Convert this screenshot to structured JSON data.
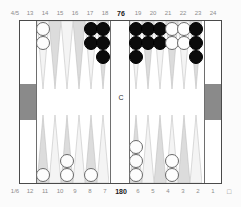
{
  "board": {
    "title": "backgammon-position-diagram",
    "bar_label": "C",
    "pip_top": "76",
    "pip_bottom": "180",
    "top_left_edge_label": "4/5",
    "bottom_left_edge_label": "1/6",
    "bottom_right_glyph": "□",
    "colors": {
      "black_checker": "#0b0b0b",
      "white_checker": "#fdfdfd",
      "point_dark": "#d7d7d7",
      "point_light": "#f4f4f4",
      "tray": "#8a8a8a",
      "frame_line": "#4a4a4a",
      "label_text": "#8c8c8c",
      "bold_text": "#1a1a1a"
    }
  },
  "labels": {
    "top": [
      "13",
      "14",
      "15",
      "16",
      "17",
      "18",
      "19",
      "20",
      "21",
      "22",
      "23",
      "24"
    ],
    "bottom": [
      "12",
      "11",
      "10",
      "9",
      "8",
      "7",
      "6",
      "5",
      "4",
      "3",
      "2",
      "1"
    ]
  },
  "points": {
    "p13": {
      "label": "13",
      "color": "white",
      "count": 2
    },
    "p14": {
      "label": "14",
      "color": "none",
      "count": 0
    },
    "p15": {
      "label": "15",
      "color": "none",
      "count": 0
    },
    "p16": {
      "label": "16",
      "color": "none",
      "count": 0
    },
    "p17": {
      "label": "17",
      "color": "black",
      "count": 2
    },
    "p18": {
      "label": "18",
      "color": "black",
      "count": 3
    },
    "p19": {
      "label": "19",
      "color": "black",
      "count": 3
    },
    "p20": {
      "label": "20",
      "color": "black",
      "count": 2
    },
    "p21": {
      "label": "21",
      "color": "black",
      "count": 2
    },
    "p22": {
      "label": "22",
      "color": "white",
      "count": 2
    },
    "p23": {
      "label": "23",
      "color": "white",
      "count": 2
    },
    "p24": {
      "label": "24",
      "color": "black",
      "count": 3
    },
    "p12": {
      "label": "12",
      "color": "white",
      "count": 1
    },
    "p11": {
      "label": "11",
      "color": "none",
      "count": 0
    },
    "p10": {
      "label": "10",
      "color": "white",
      "count": 2
    },
    "p9": {
      "label": "9",
      "color": "none",
      "count": 0
    },
    "p8": {
      "label": "8",
      "color": "white",
      "count": 1
    },
    "p7": {
      "label": "7",
      "color": "none",
      "count": 0
    },
    "p6": {
      "label": "6",
      "color": "white",
      "count": 3
    },
    "p5": {
      "label": "5",
      "color": "none",
      "count": 0
    },
    "p4": {
      "label": "4",
      "color": "none",
      "count": 0
    },
    "p3": {
      "label": "3",
      "color": "white",
      "count": 2
    },
    "p2": {
      "label": "2",
      "color": "none",
      "count": 0
    },
    "p1": {
      "label": "1",
      "color": "none",
      "count": 0
    }
  }
}
